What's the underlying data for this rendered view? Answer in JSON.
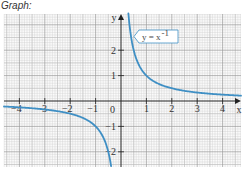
{
  "title": "Graph:",
  "chart_data": {
    "type": "line",
    "title": "Graph:",
    "function": "y = x^-1",
    "legend_label": "y = x",
    "legend_exponent": "-1",
    "xlabel": "x",
    "ylabel": "y",
    "xlim": [
      -4.5,
      4.8
    ],
    "ylim": [
      -2.6,
      3.4
    ],
    "grid": true,
    "x_ticks": [
      "-4",
      "-3",
      "-2",
      "-1",
      "1",
      "2",
      "3",
      "4"
    ],
    "y_ticks": [
      "2",
      "1",
      "-1",
      "-2"
    ],
    "origin_label": "0",
    "series": [
      {
        "name": "y = x^-1 (x > 0)",
        "x": [
          0.3,
          0.4,
          0.5,
          0.75,
          1,
          1.5,
          2,
          2.5,
          3,
          3.5,
          4,
          4.7
        ],
        "y": [
          3.33,
          2.5,
          2,
          1.33,
          1,
          0.67,
          0.5,
          0.4,
          0.33,
          0.29,
          0.25,
          0.21
        ]
      },
      {
        "name": "y = x^-1 (x < 0)",
        "x": [
          -4.7,
          -4,
          -3.5,
          -3,
          -2.5,
          -2,
          -1.5,
          -1,
          -0.75,
          -0.5,
          -0.4
        ],
        "y": [
          -0.21,
          -0.25,
          -0.29,
          -0.33,
          -0.4,
          -0.5,
          -0.67,
          -1,
          -1.33,
          -2,
          -2.5
        ]
      }
    ],
    "colors": {
      "curve": "#3f8fc4",
      "axis": "#222222",
      "grid_major": "#9a9a9a",
      "grid_minor": "#cfcfcf"
    }
  }
}
